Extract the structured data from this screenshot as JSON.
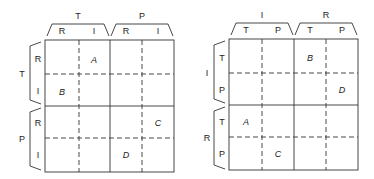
{
  "diagrams": [
    {
      "col_groups": [
        {
          "label": "T",
          "subs": [
            "R",
            "I"
          ]
        },
        {
          "label": "P",
          "subs": [
            "R",
            "I"
          ]
        }
      ],
      "row_groups": [
        {
          "label": "T",
          "subs": [
            "R",
            "I"
          ]
        },
        {
          "label": "P",
          "subs": [
            "R",
            "I"
          ]
        }
      ],
      "cells": [
        {
          "label": "A",
          "row": 0,
          "col": 1
        },
        {
          "label": "B",
          "row": 1,
          "col": 0
        },
        {
          "label": "C",
          "row": 2,
          "col": 3
        },
        {
          "label": "D",
          "row": 3,
          "col": 2
        }
      ]
    },
    {
      "col_groups": [
        {
          "label": "I",
          "subs": [
            "T",
            "P"
          ]
        },
        {
          "label": "R",
          "subs": [
            "T",
            "P"
          ]
        }
      ],
      "row_groups": [
        {
          "label": "I",
          "subs": [
            "T",
            "P"
          ]
        },
        {
          "label": "R",
          "subs": [
            "T",
            "P"
          ]
        }
      ],
      "cells": [
        {
          "label": "B",
          "row": 0,
          "col": 2
        },
        {
          "label": "D",
          "row": 1,
          "col": 3
        },
        {
          "label": "A",
          "row": 2,
          "col": 0
        },
        {
          "label": "C",
          "row": 3,
          "col": 1
        }
      ]
    }
  ]
}
